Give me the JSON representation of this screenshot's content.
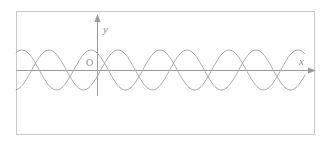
{
  "figure": {
    "background_color": "#ffffff",
    "frame": {
      "name": "figure-border",
      "x": 16,
      "y": 11,
      "width": 299,
      "height": 124,
      "stroke": "#c9c9c9",
      "stroke_width": 1
    },
    "labels": {
      "y_axis": "y",
      "x_axis": "x",
      "origin": "O"
    },
    "colors": {
      "axis": "#9a9a9a",
      "curve": "#a0a0a0",
      "border": "#c9c9c9",
      "label": "#8c8c8c"
    }
  },
  "chart_data": {
    "type": "line",
    "title": "",
    "xlabel": "x",
    "ylabel": "y",
    "grid": false,
    "legend": "none",
    "axes": {
      "x_axis_y_px": 70,
      "y_axis_x_px": 97,
      "x_axis_start_px": 16,
      "x_axis_end_px": 316,
      "y_axis_top_px": 15,
      "y_axis_bottom_px": 96,
      "x_arrow": true,
      "y_arrow": true,
      "origin_label": "O"
    },
    "domain_px": [
      16,
      305
    ],
    "amplitude_px": 20,
    "period_px": 69,
    "series": [
      {
        "name": "curve-1",
        "phase_px": 22,
        "description": "sinusoid with crest near left border, peaks at x=22, 91, 160, 229, 298",
        "peaks_px": [
          22,
          91,
          160,
          229,
          298
        ],
        "troughs_px": [
          57,
          126,
          195,
          264
        ]
      },
      {
        "name": "curve-2",
        "phase_px": 49,
        "description": "sinusoid shifted right by about 27 px, peaks at x=49, 118, 187, 256",
        "peaks_px": [
          49,
          118,
          187,
          256
        ],
        "troughs_px": [
          84,
          153,
          222,
          291
        ]
      }
    ]
  }
}
